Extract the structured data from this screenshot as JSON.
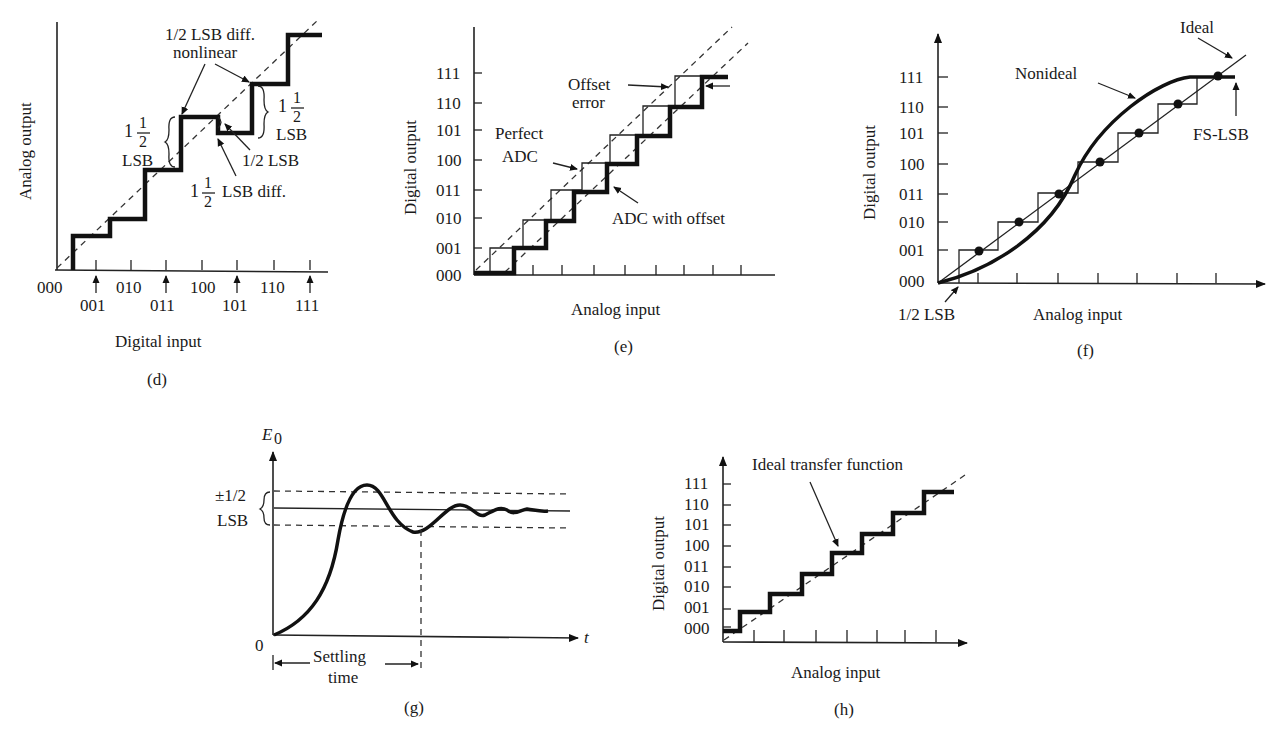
{
  "panels": {
    "d": {
      "caption": "(d)",
      "ylabel": "Analog output",
      "xlabel": "Digital input",
      "x_ticks_top": [
        "000",
        "010",
        "100",
        "110"
      ],
      "x_ticks_bottom": [
        "001",
        "011",
        "101",
        "111"
      ],
      "annotations": {
        "nonlinear_1": "1/2 LSB diff.",
        "nonlinear_2": "nonlinear",
        "left_one": "1",
        "left_half_num": "1",
        "left_half_den": "2",
        "left_lsb": "LSB",
        "right_one": "1",
        "right_half_num": "1",
        "right_half_den": "2",
        "right_lsb": "LSB",
        "half_lsb": "1/2 LSB",
        "diff_one": "1",
        "diff_half_num": "1",
        "diff_half_den": "2",
        "diff_text": "LSB diff."
      }
    },
    "e": {
      "caption": "(e)",
      "ylabel": "Digital output",
      "xlabel": "Analog input",
      "y_ticks": [
        "111",
        "110",
        "101",
        "100",
        "011",
        "010",
        "001",
        "000"
      ],
      "annotations": {
        "offset_1": "Offset",
        "offset_2": "error",
        "perfect_1": "Perfect",
        "perfect_2": "ADC",
        "with_offset": "ADC with offset"
      }
    },
    "f": {
      "caption": "(f)",
      "ylabel": "Digital output",
      "xlabel": "Analog input",
      "y_ticks": [
        "111",
        "110",
        "101",
        "100",
        "011",
        "010",
        "001",
        "000"
      ],
      "annotations": {
        "ideal": "Ideal",
        "nonideal": "Nonideal",
        "fs_lsb": "FS-LSB",
        "half_lsb": "1/2 LSB"
      }
    },
    "g": {
      "caption": "(g)",
      "ylabel": "E",
      "ylabel_sub": "0",
      "xlabel": "t",
      "origin": "0",
      "annotations": {
        "band_1": "±1/2",
        "band_2": "LSB",
        "settling_1": "Settling",
        "settling_2": "time"
      }
    },
    "h": {
      "caption": "(h)",
      "ylabel": "Digital output",
      "xlabel": "Analog input",
      "y_ticks": [
        "111",
        "110",
        "101",
        "100",
        "011",
        "010",
        "001",
        "000"
      ],
      "annotations": {
        "ideal_tf": "Ideal transfer function"
      }
    }
  }
}
